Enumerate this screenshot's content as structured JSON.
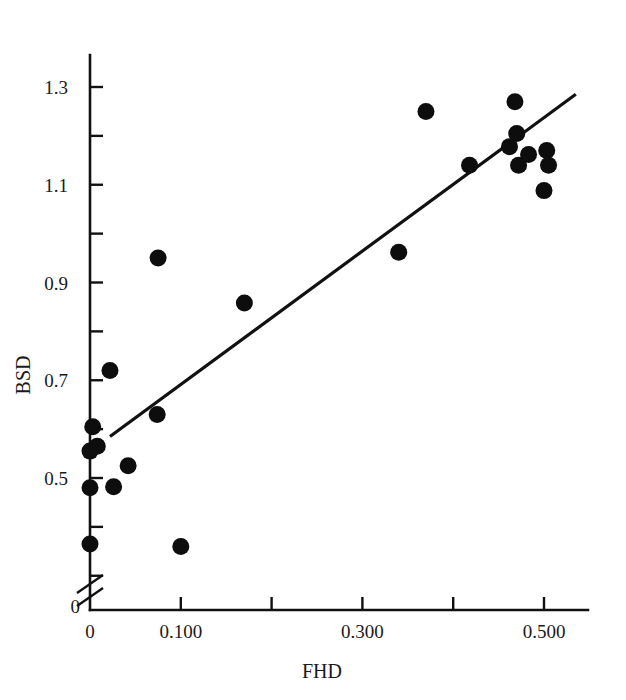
{
  "figure": {
    "background": "#ffffff",
    "marker_color": "#0d0d0d",
    "axis_color": "#111111"
  },
  "chart_data": {
    "type": "scatter",
    "title": "",
    "xlabel": "FHD",
    "ylabel": "BSD",
    "xlim": [
      0,
      0.56
    ],
    "ylim": [
      0.3,
      1.37
    ],
    "grid": false,
    "legend": "none",
    "axis_break": {
      "axis": "y",
      "symbol": "double-slash",
      "note": "y-axis broken just above origin"
    },
    "xticks": [
      0,
      0.1,
      0.2,
      0.3,
      0.4,
      0.5
    ],
    "xticklabels": [
      "0",
      "0.100",
      "",
      "0.300",
      "",
      "0.500"
    ],
    "yticks": [
      0.3,
      0.4,
      0.5,
      0.6,
      0.7,
      0.8,
      0.9,
      1.0,
      1.1,
      1.2,
      1.3
    ],
    "yticklabels": [
      "",
      "",
      "0.5",
      "",
      "0.7",
      "",
      "0.9",
      "",
      "1.1",
      "",
      "1.3"
    ],
    "y_origin_label": "0",
    "points": [
      {
        "x": 0.0,
        "y": 0.555
      },
      {
        "x": 0.0,
        "y": 0.48
      },
      {
        "x": 0.0,
        "y": 0.365
      },
      {
        "x": 0.003,
        "y": 0.605
      },
      {
        "x": 0.008,
        "y": 0.565
      },
      {
        "x": 0.022,
        "y": 0.72
      },
      {
        "x": 0.026,
        "y": 0.482
      },
      {
        "x": 0.042,
        "y": 0.525
      },
      {
        "x": 0.074,
        "y": 0.63
      },
      {
        "x": 0.075,
        "y": 0.95
      },
      {
        "x": 0.1,
        "y": 0.36
      },
      {
        "x": 0.17,
        "y": 0.858
      },
      {
        "x": 0.34,
        "y": 0.962
      },
      {
        "x": 0.37,
        "y": 1.25
      },
      {
        "x": 0.418,
        "y": 1.14
      },
      {
        "x": 0.462,
        "y": 1.178
      },
      {
        "x": 0.468,
        "y": 1.27
      },
      {
        "x": 0.47,
        "y": 1.205
      },
      {
        "x": 0.472,
        "y": 1.14
      },
      {
        "x": 0.483,
        "y": 1.162
      },
      {
        "x": 0.5,
        "y": 1.088
      },
      {
        "x": 0.503,
        "y": 1.17
      },
      {
        "x": 0.505,
        "y": 1.14
      }
    ],
    "fit_line": {
      "type": "linear",
      "x_start": 0.022,
      "y_start": 0.585,
      "x_end": 0.535,
      "y_end": 1.285
    },
    "marker": {
      "shape": "circle",
      "radius_px": 8.5
    }
  }
}
